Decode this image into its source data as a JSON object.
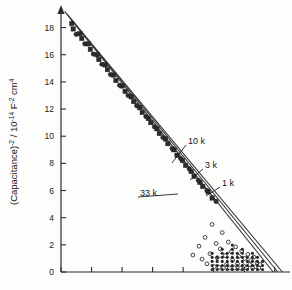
{
  "chart_data": {
    "type": "scatter",
    "title": "",
    "subtitle": "",
    "xlabel": "",
    "ylabel": "(Capacitance)⁻² / 10⁻¹⁴ F⁻² cm⁴",
    "ylabel_parts": {
      "base1": "(Capacitance)",
      "exp1": "-2",
      "mid": " / 10",
      "exp2": "-14",
      "base2": " F",
      "exp3": "-2",
      "base3": " cm",
      "exp4": "4"
    },
    "ylim": [
      0,
      19
    ],
    "xlim": [
      0,
      7.5
    ],
    "yticks": [
      0,
      2,
      4,
      6,
      8,
      10,
      12,
      14,
      16,
      18
    ],
    "ytick_labels": [
      "0",
      "2",
      "4",
      "6",
      "8",
      "10",
      "12",
      "14",
      "16",
      "18"
    ],
    "xticks": [
      0,
      1,
      2,
      3,
      4,
      5,
      6,
      7
    ],
    "xtick_labels": [
      "",
      "",
      "",
      "",
      "",
      "",
      "",
      ""
    ],
    "grid": false,
    "legend_position": "inline-annotations",
    "y_axis_arrow": true,
    "annotations": [
      {
        "label": "10 k",
        "x_px": 188,
        "y_px": 144,
        "leader_to_x_px": 172,
        "leader_to_y_px": 163
      },
      {
        "label": "3 k",
        "x_px": 205,
        "y_px": 168,
        "leader_to_x_px": 190,
        "leader_to_y_px": 180
      },
      {
        "label": "1 k",
        "x_px": 222,
        "y_px": 186,
        "leader_to_x_px": 206,
        "leader_to_y_px": 196
      },
      {
        "label": "33 k",
        "x_px": 140,
        "y_px": 196,
        "leader_to_x_px": 178,
        "leader_to_y_px": 194
      }
    ],
    "series": [
      {
        "name": "1k",
        "label": "1 k",
        "marker": "filled-square",
        "line": {
          "x0": 0.12,
          "y0": 19.2,
          "x1": 6.95,
          "y1": 0.0
        },
        "x": [
          0.35,
          0.62,
          0.9,
          1.18,
          1.45,
          1.72,
          2.0,
          2.3,
          2.58,
          2.86,
          3.14,
          3.42,
          3.7,
          3.98,
          4.26,
          4.55,
          4.82
        ],
        "y": [
          18.3,
          17.55,
          16.8,
          16.0,
          15.25,
          14.5,
          13.7,
          12.9,
          12.1,
          11.3,
          10.55,
          9.8,
          9.0,
          8.2,
          7.4,
          6.6,
          5.9
        ]
      },
      {
        "name": "3k",
        "label": "3 k",
        "marker": "filled-square",
        "line": {
          "x0": 0.2,
          "y0": 19.0,
          "x1": 7.1,
          "y1": 0.0
        },
        "x": [
          0.4,
          0.68,
          0.96,
          1.24,
          1.52,
          1.8,
          2.1,
          2.38,
          2.66,
          2.94,
          3.22,
          3.5,
          3.8,
          4.08,
          4.36,
          4.64,
          4.95
        ],
        "y": [
          17.9,
          17.2,
          16.4,
          15.65,
          14.9,
          14.1,
          13.3,
          12.55,
          11.75,
          11.0,
          10.2,
          9.45,
          8.6,
          7.85,
          7.05,
          6.3,
          5.45
        ]
      },
      {
        "name": "10k",
        "label": "10 k",
        "marker": "filled-circle",
        "line": {
          "x0": 0.3,
          "y0": 18.7,
          "x1": 7.25,
          "y1": 0.0
        },
        "x": [
          0.5,
          0.78,
          1.06,
          1.34,
          1.62,
          1.92,
          2.2,
          2.48,
          2.78,
          3.06,
          3.34,
          3.64,
          3.92,
          4.2,
          4.5,
          4.78,
          5.08
        ],
        "y": [
          17.5,
          16.8,
          16.05,
          15.3,
          14.55,
          13.75,
          13.0,
          12.25,
          11.45,
          10.7,
          9.9,
          9.1,
          8.35,
          7.6,
          6.75,
          6.0,
          5.2
        ]
      },
      {
        "name": "33k",
        "label": "33 k",
        "marker": "open-circle",
        "line": null,
        "x": [
          4.32,
          4.52,
          4.62,
          4.72,
          4.78,
          4.88,
          4.95,
          5.02,
          5.08,
          5.12,
          5.18,
          5.22,
          5.28,
          5.32,
          5.38,
          5.42,
          5.48,
          5.52,
          5.58,
          5.62,
          5.68,
          5.72,
          5.78,
          5.82,
          5.88,
          5.92,
          5.98,
          6.02,
          6.08,
          6.12,
          6.18,
          6.22,
          6.28,
          6.32,
          6.38,
          6.42,
          6.48,
          6.52
        ],
        "y": [
          1.25,
          1.9,
          0.95,
          2.55,
          0.6,
          1.35,
          3.5,
          0.4,
          2.1,
          1.05,
          0.35,
          1.7,
          2.9,
          0.3,
          1.2,
          0.55,
          2.2,
          0.3,
          1.5,
          0.9,
          0.3,
          1.85,
          0.6,
          1.15,
          0.3,
          1.55,
          0.45,
          1.0,
          0.3,
          1.3,
          0.55,
          0.85,
          0.3,
          1.1,
          0.4,
          0.7,
          0.3,
          0.55
        ]
      }
    ],
    "scatter_cloud_note": "33k series forms a low scattered cloud near the baseline with stacked vertical columns"
  }
}
